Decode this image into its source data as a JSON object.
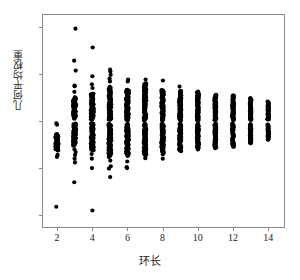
{
  "chart_data": {
    "type": "scatter",
    "title": "",
    "xlabel": "环长",
    "ylabel": "几何平均权重",
    "xlim": [
      1.2,
      14.9
    ],
    "ylim": [
      -2.25,
      2.25
    ],
    "grid": false,
    "legend": "none",
    "marker": {
      "shape": "circle",
      "color": "#000000",
      "size": 2.1
    },
    "xticks": [
      2,
      4,
      6,
      8,
      10,
      12,
      14
    ],
    "xtick_labels": [
      "2",
      "4",
      "6",
      "8",
      "10",
      "12",
      "14"
    ],
    "yticks": [
      2,
      1,
      0,
      -1,
      -2
    ],
    "ytick_labels": [
      "2",
      "1",
      "0",
      "-1",
      "-2"
    ],
    "series": [
      {
        "name": "几何平均权重",
        "columns": [
          {
            "x": 2,
            "dense_bands": [
              [
                -0.62,
                -0.28
              ]
            ],
            "sparse": [
              -0.05,
              -0.08,
              -0.72,
              -0.76,
              -1.82
            ]
          },
          {
            "x": 3,
            "dense_bands": [
              [
                0.05,
                0.5
              ],
              [
                -0.52,
                -0.06
              ]
            ],
            "sparse": [
              1.96,
              1.28,
              1.07,
              0.75,
              0.74,
              0.62,
              -0.6,
              -0.66,
              -0.72,
              -0.8,
              -0.88,
              -1.3
            ]
          },
          {
            "x": 4,
            "dense_bands": [
              [
                0.03,
                0.58
              ],
              [
                -0.62,
                -0.06
              ]
            ],
            "sparse": [
              1.56,
              0.95,
              0.78,
              0.7,
              -0.7,
              -0.8,
              -1.0,
              -1.9
            ]
          },
          {
            "x": 5,
            "dense_bands": [
              [
                0.02,
                0.72
              ],
              [
                -0.76,
                -0.06
              ]
            ],
            "sparse": [
              1.09,
              1.05,
              0.98,
              0.9,
              0.84,
              -0.84,
              -0.96,
              -1.01,
              -1.19
            ]
          },
          {
            "x": 6,
            "dense_bands": [
              [
                0.02,
                0.66
              ],
              [
                -0.74,
                -0.06
              ]
            ],
            "sparse": [
              0.88,
              0.84,
              -0.86,
              -0.98,
              -1.0
            ]
          },
          {
            "x": 7,
            "dense_bands": [
              [
                0.01,
                0.8
              ],
              [
                -0.72,
                -0.06
              ]
            ],
            "sparse": [
              0.88,
              -0.79
            ]
          },
          {
            "x": 8,
            "dense_bands": [
              [
                0.01,
                0.66
              ],
              [
                -0.7,
                -0.06
              ]
            ],
            "sparse": [
              0.86,
              -0.8
            ]
          },
          {
            "x": 9,
            "dense_bands": [
              [
                0.01,
                0.64
              ],
              [
                -0.64,
                -0.06
              ]
            ],
            "sparse": [
              0.73
            ]
          },
          {
            "x": 10,
            "dense_bands": [
              [
                0.01,
                0.62
              ],
              [
                -0.6,
                -0.06
              ]
            ],
            "sparse": []
          },
          {
            "x": 11,
            "dense_bands": [
              [
                0.01,
                0.55
              ],
              [
                -0.57,
                -0.06
              ]
            ],
            "sparse": []
          },
          {
            "x": 12,
            "dense_bands": [
              [
                0.01,
                0.54
              ],
              [
                -0.55,
                -0.06
              ]
            ],
            "sparse": []
          },
          {
            "x": 13,
            "dense_bands": [
              [
                0.02,
                0.48
              ],
              [
                -0.48,
                -0.07
              ]
            ],
            "sparse": []
          },
          {
            "x": 14,
            "dense_bands": [
              [
                0.03,
                0.41
              ],
              [
                -0.4,
                -0.08
              ]
            ],
            "sparse": []
          }
        ]
      }
    ]
  },
  "axes": {
    "x_title": "环长",
    "y_title": "几何平均权重",
    "x_tick_labels": [
      "2",
      "4",
      "6",
      "8",
      "10",
      "12",
      "14"
    ],
    "y_tick_labels": [
      "2",
      "1",
      "0",
      "-1",
      "-2"
    ],
    "frame_color": "#8a8a8a",
    "point_color": "#000000"
  },
  "caption_strip": ""
}
